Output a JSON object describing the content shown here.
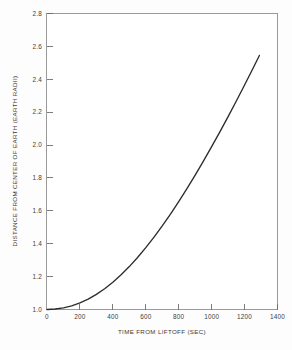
{
  "chart_data": {
    "type": "line",
    "title": "",
    "xlabel": "TIME FROM LIFTOFF (SEC)",
    "ylabel": "DISTANCE FROM CENTER OF EARTH (EARTH RADII)",
    "xlim": [
      0,
      1400
    ],
    "ylim": [
      1.0,
      2.8
    ],
    "grid": false,
    "legend": null,
    "xticks": [
      0,
      200,
      400,
      600,
      800,
      1000,
      1200,
      1400
    ],
    "xtick_labels": [
      "0",
      "200",
      "400",
      "600",
      "800",
      "1000",
      "1200",
      "1400"
    ],
    "yticks": [
      1.0,
      1.2,
      1.4,
      1.6,
      1.8,
      2.0,
      2.2,
      2.4,
      2.6,
      2.8
    ],
    "ytick_labels": [
      "1.0",
      "1.2",
      "1.4",
      "1.6",
      "1.8",
      "2.0",
      "2.2",
      "2.4",
      "2.6",
      "2.8"
    ],
    "series": [
      {
        "name": "trajectory",
        "color": "#2c2c2c",
        "x": [
          0,
          50,
          100,
          150,
          200,
          250,
          300,
          350,
          400,
          450,
          500,
          550,
          600,
          650,
          700,
          750,
          800,
          850,
          900,
          950,
          1000,
          1050,
          1100,
          1150,
          1200,
          1250,
          1290
        ],
        "y": [
          1.0,
          1.003,
          1.01,
          1.022,
          1.04,
          1.063,
          1.092,
          1.126,
          1.166,
          1.211,
          1.261,
          1.316,
          1.376,
          1.44,
          1.508,
          1.58,
          1.656,
          1.735,
          1.817,
          1.902,
          1.99,
          2.08,
          2.173,
          2.268,
          2.365,
          2.464,
          2.545
        ]
      }
    ],
    "curve_points_px": {
      "note": "polyline in svg user units matching plot frame 46,13 to 278,310"
    }
  },
  "figure": {
    "background_color": "#fdfdfd",
    "plot_background_color": "#ffffff",
    "frame_color": "#9a9a9a",
    "curve_color": "#2c2c2c",
    "tick_color": "#6f6f6f"
  }
}
